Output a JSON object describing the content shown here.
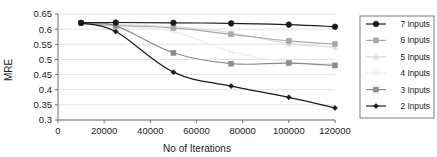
{
  "chart_data": {
    "type": "line",
    "title": "",
    "xlabel": "No of Iterations",
    "ylabel": "MRE",
    "xlim": [
      0,
      120000
    ],
    "ylim": [
      0.3,
      0.65
    ],
    "xticks": [
      0,
      20000,
      40000,
      60000,
      80000,
      100000,
      120000
    ],
    "xtick_labels": [
      "0",
      "20000",
      "40000",
      "60000",
      "80000",
      "100000",
      "120000"
    ],
    "yticks": [
      0.3,
      0.35,
      0.4,
      0.45,
      0.5,
      0.55,
      0.6,
      0.65
    ],
    "ytick_labels": [
      "0.3",
      "0.35",
      "0.4",
      "0.45",
      "0.5",
      "0.55",
      "0.6",
      "0.65"
    ],
    "grid": "horizontal",
    "legend_position": "right-outside",
    "x": [
      10000,
      25000,
      50000,
      75000,
      100000,
      120000
    ],
    "series": [
      {
        "name": "7 Inputs",
        "values": [
          0.621,
          0.622,
          0.621,
          0.619,
          0.615,
          0.608
        ],
        "color": "#1a1a1a",
        "marker": "circle"
      },
      {
        "name": "6 Inputs",
        "values": [
          0.62,
          0.612,
          0.604,
          0.583,
          0.561,
          0.551
        ],
        "color": "#a8a8a8",
        "marker": "square"
      },
      {
        "name": "5 Inputs",
        "values": [
          0.62,
          0.615,
          0.608,
          0.588,
          0.552,
          0.541
        ],
        "color": "#dcdcdc",
        "marker": "triangle"
      },
      {
        "name": "4 Inputs",
        "values": [
          0.62,
          0.61,
          0.592,
          0.525,
          0.492,
          0.487
        ],
        "color": "#ececec",
        "marker": "cross"
      },
      {
        "name": "3 Inputs",
        "values": [
          0.62,
          0.611,
          0.522,
          0.486,
          0.488,
          0.48
        ],
        "color": "#8c8c8c",
        "marker": "square"
      },
      {
        "name": "2 Inputs",
        "values": [
          0.62,
          0.592,
          0.458,
          0.412,
          0.375,
          0.34
        ],
        "color": "#1a1a1a",
        "marker": "diamond"
      }
    ],
    "annotations": {
      "dark_series_note": "7 Inputs remains near 0.62 across all iterations",
      "bottom_series_note": "2 Inputs declines steadily to 0.34"
    }
  },
  "legend": {
    "entries": [
      {
        "label": "7 Inputs"
      },
      {
        "label": "6 Inputs"
      },
      {
        "label": "5 Inputs"
      },
      {
        "label": "4 Inputs"
      },
      {
        "label": "3 Inputs"
      },
      {
        "label": "2 Inputs"
      }
    ]
  }
}
